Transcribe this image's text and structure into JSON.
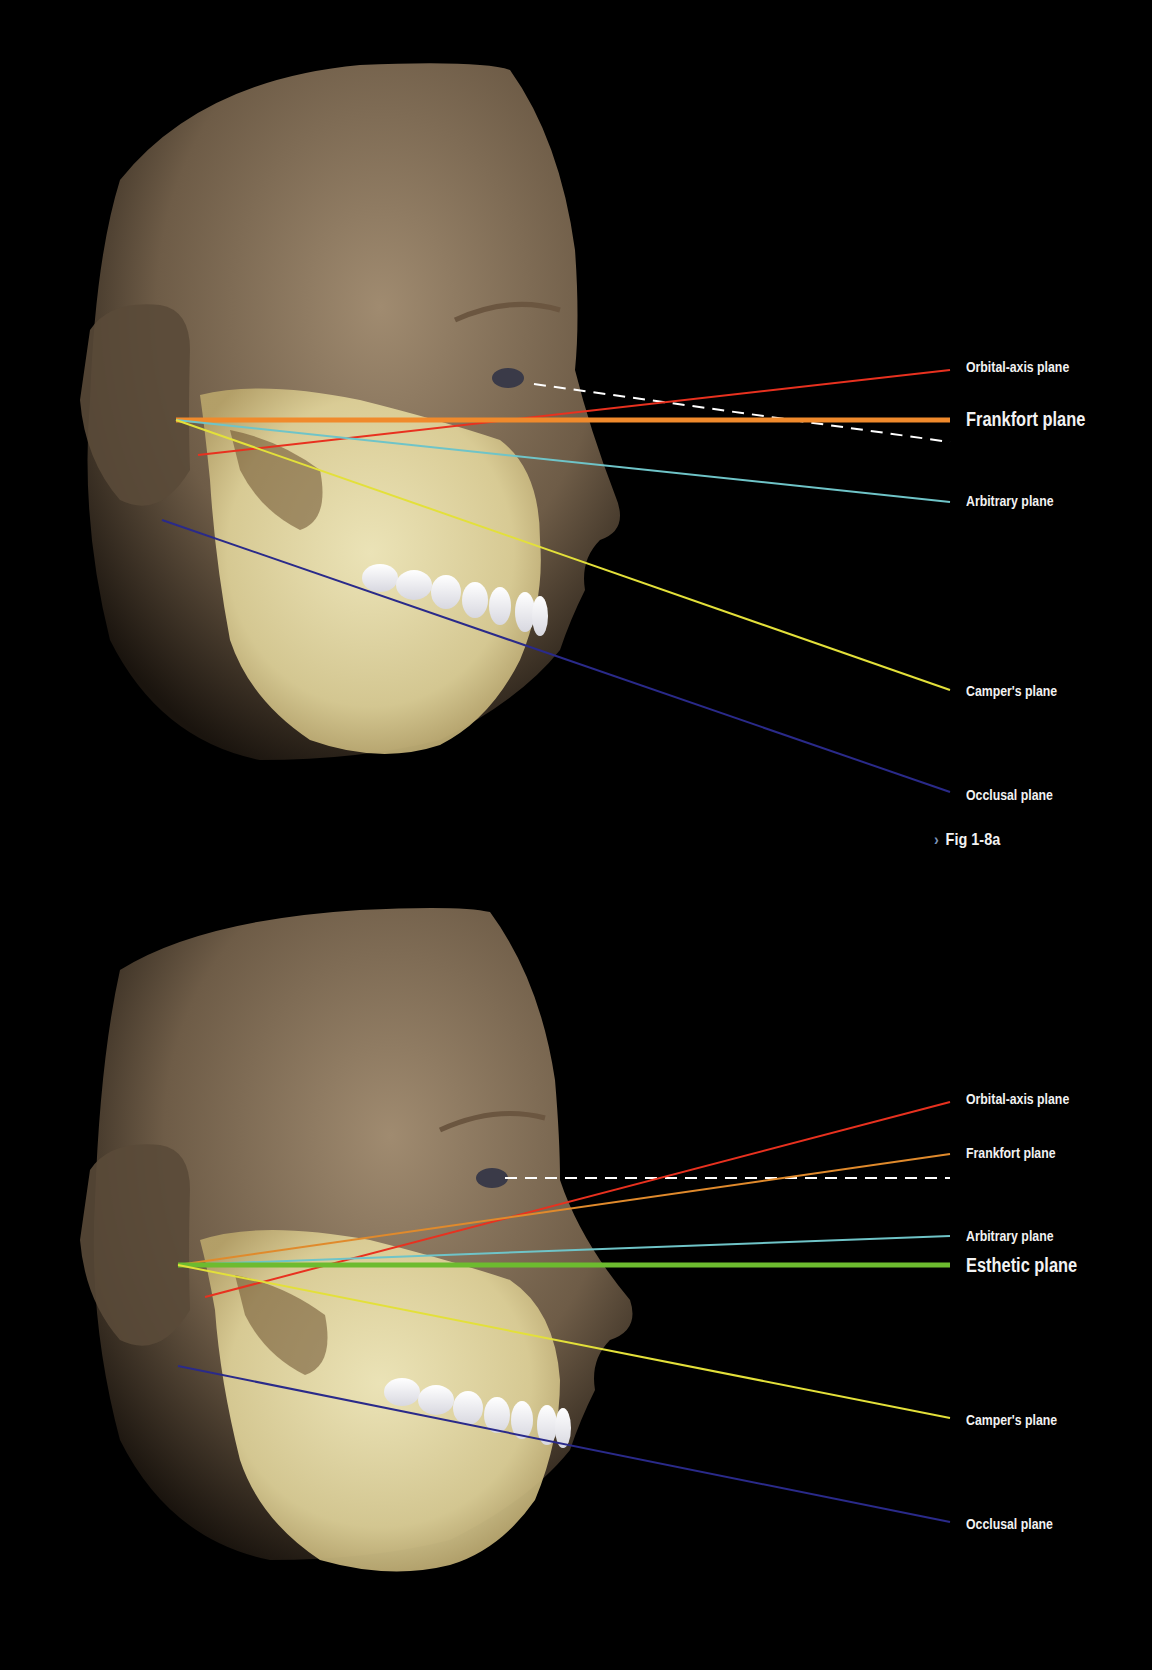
{
  "figure_a": {
    "caption_marker": "›",
    "caption": "Fig 1-8a",
    "labels": [
      {
        "id": "orbital-axis",
        "text": "Orbital-axis plane",
        "color": "#e8311f",
        "emphasis": false
      },
      {
        "id": "frankfort",
        "text": "Frankfort plane",
        "color": "#f08a2c",
        "emphasis": true
      },
      {
        "id": "arbitrary",
        "text": "Arbitrary plane",
        "color": "#6fc4c8",
        "emphasis": false
      },
      {
        "id": "campers",
        "text": "Camper's plane",
        "color": "#e3e03a",
        "emphasis": false
      },
      {
        "id": "occlusal",
        "text": "Occlusal plane",
        "color": "#2a2a8a",
        "emphasis": false
      }
    ]
  },
  "figure_b": {
    "labels": [
      {
        "id": "orbital-axis",
        "text": "Orbital-axis plane",
        "color": "#e8311f",
        "emphasis": false
      },
      {
        "id": "frankfort",
        "text": "Frankfort plane",
        "color": "#e08a2c",
        "emphasis": false
      },
      {
        "id": "arbitrary",
        "text": "Arbitrary plane",
        "color": "#6fc4c8",
        "emphasis": false
      },
      {
        "id": "esthetic",
        "text": "Esthetic plane",
        "color": "#6dbb2f",
        "emphasis": true
      },
      {
        "id": "campers",
        "text": "Camper's plane",
        "color": "#e3e03a",
        "emphasis": false
      },
      {
        "id": "occlusal",
        "text": "Occlusal plane",
        "color": "#2a2a8a",
        "emphasis": false
      }
    ]
  }
}
